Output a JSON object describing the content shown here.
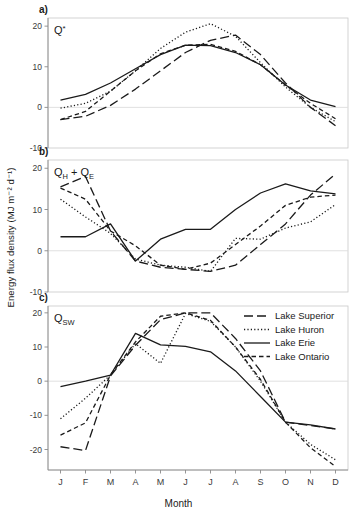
{
  "figure": {
    "xlabel": "Month",
    "ylabel": "Energy flux density (MJ m⁻² d⁻¹)",
    "months": [
      "J",
      "F",
      "M",
      "A",
      "M",
      "J",
      "J",
      "A",
      "S",
      "O",
      "N",
      "D"
    ]
  },
  "legend": {
    "position": "panel-c-top-right",
    "entries": [
      {
        "label": "Lake Superior",
        "style": "long-dash"
      },
      {
        "label": "Lake Huron",
        "style": "dotted"
      },
      {
        "label": "Lake Erie",
        "style": "solid"
      },
      {
        "label": "Lake Ontario",
        "style": "dashed"
      }
    ]
  },
  "panels": {
    "a": {
      "letter": "a)",
      "var_main": "Q",
      "var_sup": "*",
      "var_sub": ""
    },
    "b": {
      "letter": "b)",
      "var_main": "Q",
      "var_sub": "H",
      "var_main2": "Q",
      "var_sub2": "E",
      "plus": "+"
    },
    "c": {
      "letter": "c)",
      "var_main": "Q",
      "var_sub": "SW"
    }
  },
  "chart_data": [
    {
      "id": "a",
      "type": "line",
      "title": "Q*",
      "panel_label": "a)",
      "xlabel": "",
      "ylabel": "Energy flux density (MJ m-2 d-1)",
      "categories": [
        "J",
        "F",
        "M",
        "A",
        "M",
        "J",
        "J",
        "A",
        "S",
        "O",
        "N",
        "D"
      ],
      "ylim": [
        -10,
        22
      ],
      "yticks": [
        -10,
        0,
        10,
        20
      ],
      "grid": false,
      "zero_line": true,
      "series": [
        {
          "name": "Lake Superior",
          "style": "long-dash",
          "values": [
            -3.0,
            -2.2,
            0.5,
            4.5,
            9.0,
            13.5,
            16.5,
            17.8,
            13.0,
            6.0,
            0.0,
            -4.5
          ]
        },
        {
          "name": "Lake Huron",
          "style": "dotted",
          "values": [
            -0.2,
            1.0,
            4.0,
            9.0,
            14.5,
            18.5,
            20.6,
            17.5,
            11.0,
            5.0,
            0.0,
            -3.5
          ]
        },
        {
          "name": "Lake Erie",
          "style": "solid",
          "values": [
            1.8,
            3.2,
            6.0,
            9.5,
            13.0,
            15.3,
            15.2,
            13.5,
            10.5,
            5.5,
            1.8,
            0.2
          ]
        },
        {
          "name": "Lake Ontario",
          "style": "dashed",
          "values": [
            -3.0,
            -1.0,
            4.0,
            9.0,
            13.2,
            15.3,
            15.5,
            13.8,
            10.5,
            5.5,
            1.0,
            -2.8
          ]
        }
      ]
    },
    {
      "id": "b",
      "type": "line",
      "title": "QH + QE",
      "panel_label": "b)",
      "xlabel": "",
      "ylabel": "Energy flux density (MJ m-2 d-1)",
      "categories": [
        "J",
        "F",
        "M",
        "A",
        "M",
        "J",
        "J",
        "A",
        "S",
        "O",
        "N",
        "D"
      ],
      "ylim": [
        -10,
        22
      ],
      "yticks": [
        -10,
        0,
        10,
        20
      ],
      "grid": false,
      "zero_line": true,
      "series": [
        {
          "name": "Lake Superior",
          "style": "long-dash",
          "values": [
            15.5,
            18.0,
            4.8,
            -2.5,
            -4.0,
            -4.5,
            -5.0,
            -3.5,
            1.5,
            6.5,
            13.5,
            18.6
          ]
        },
        {
          "name": "Lake Huron",
          "style": "dotted",
          "values": [
            12.5,
            8.2,
            4.2,
            -2.0,
            -3.5,
            -4.0,
            -5.0,
            3.0,
            2.8,
            5.5,
            7.0,
            11.2
          ]
        },
        {
          "name": "Lake Erie",
          "style": "solid",
          "values": [
            3.4,
            3.4,
            6.5,
            -2.5,
            2.8,
            5.2,
            5.2,
            10.0,
            14.0,
            16.2,
            14.5,
            13.8
          ]
        },
        {
          "name": "Lake Ontario",
          "style": "dashed",
          "values": [
            15.2,
            12.5,
            4.8,
            1.2,
            -3.5,
            -4.5,
            -3.0,
            1.5,
            6.0,
            11.0,
            13.0,
            13.5
          ]
        }
      ]
    },
    {
      "id": "c",
      "type": "line",
      "title": "QSW",
      "panel_label": "c)",
      "xlabel": "Month",
      "ylabel": "Energy flux density (MJ m-2 d-1)",
      "categories": [
        "J",
        "F",
        "M",
        "A",
        "M",
        "J",
        "J",
        "A",
        "S",
        "O",
        "N",
        "D"
      ],
      "ylim": [
        -26,
        22
      ],
      "yticks": [
        -20,
        -10,
        0,
        10,
        20
      ],
      "grid": false,
      "zero_line": true,
      "series": [
        {
          "name": "Lake Superior",
          "style": "long-dash",
          "values": [
            -19.2,
            -20.3,
            1.5,
            10.5,
            18.0,
            20.0,
            20.0,
            12.5,
            3.0,
            -12.0,
            -13.0,
            -14.0
          ]
        },
        {
          "name": "Lake Huron",
          "style": "dotted",
          "values": [
            -11.0,
            -5.0,
            1.8,
            11.0,
            5.2,
            19.8,
            17.5,
            10.0,
            0.0,
            -12.0,
            -18.5,
            -23.0
          ]
        },
        {
          "name": "Lake Erie",
          "style": "solid",
          "values": [
            -1.6,
            0.0,
            1.8,
            14.0,
            10.6,
            10.2,
            8.6,
            3.0,
            -4.5,
            -12.0,
            -12.8,
            -14.0
          ]
        },
        {
          "name": "Lake Ontario",
          "style": "dashed",
          "values": [
            -15.8,
            -12.2,
            1.8,
            11.5,
            19.0,
            20.0,
            17.8,
            10.0,
            0.5,
            -12.0,
            -19.5,
            -25.0
          ]
        }
      ]
    }
  ]
}
